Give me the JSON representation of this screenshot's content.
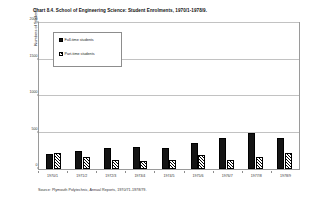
{
  "chart_data": {
    "type": "bar",
    "title": "Chart 8.4. School of Engineering Science: Student Enrolments, 1970/1-1978/9.",
    "xlabel": "",
    "ylabel": "Numbers of Students",
    "categories": [
      "1970/1",
      "1971/2",
      "1972/3",
      "1973/4",
      "1974/5",
      "1975/6",
      "1976/7",
      "1977/8",
      "1978/9"
    ],
    "series": [
      {
        "name": "Full-time students",
        "values": [
          205,
          240,
          290,
          300,
          285,
          350,
          420,
          500,
          430
        ]
      },
      {
        "name": "Part-time students",
        "values": [
          215,
          160,
          130,
          105,
          125,
          195,
          130,
          170,
          215
        ]
      }
    ],
    "ylim": [
      0,
      2000
    ],
    "yticks": [
      0,
      500,
      1000,
      1500,
      2000
    ],
    "ytick_labels": [
      "0",
      "500",
      "1000",
      "1500",
      "2000"
    ],
    "grid": true,
    "legend_position": "upper left",
    "colors": {
      "full_time": "#141414",
      "part_time": "#ffffff",
      "hatch": "#000000",
      "grid": "#c2c2c2",
      "frame": "#9a9a9a"
    }
  },
  "source_note": "Source: Plymouth Polytechnic, Annual Reports, 1970/71-1978/79."
}
